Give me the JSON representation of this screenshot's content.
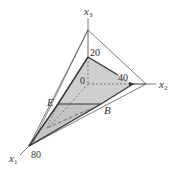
{
  "diagram": {
    "type": "3d-coordinate-polytope",
    "axes": {
      "x1": {
        "label": "x",
        "subscript": "1"
      },
      "x2": {
        "label": "x",
        "subscript": "2"
      },
      "x3": {
        "label": "x",
        "subscript": "3"
      }
    },
    "tick_labels": {
      "x3_value": "20",
      "x2_value": "40",
      "x1_value": "80",
      "origin": "0"
    },
    "point_labels": {
      "E": "E",
      "B": "B"
    },
    "colors": {
      "shaded_face": "#cfcfcf",
      "lines": "#333333",
      "dashed": "#555555"
    }
  }
}
